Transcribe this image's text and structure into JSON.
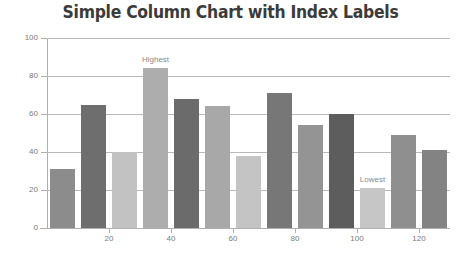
{
  "chart_data": {
    "type": "bar",
    "title": "Simple Column Chart with Index Labels",
    "xlabel": "",
    "ylabel": "",
    "ylim": [
      0,
      100
    ],
    "xlim": [
      0,
      140
    ],
    "grid": true,
    "legend": false,
    "y_ticks": [
      "0",
      "20",
      "40",
      "60",
      "80",
      "100"
    ],
    "y_tick_values": [
      0,
      20,
      40,
      60,
      80,
      100
    ],
    "x_ticks": [
      "20",
      "40",
      "60",
      "80",
      "100",
      "120"
    ],
    "x_tick_values": [
      20,
      40,
      60,
      80,
      100,
      120
    ],
    "categories": [
      10,
      20,
      30,
      40,
      50,
      60,
      70,
      80,
      90,
      100,
      110,
      120,
      130
    ],
    "values": [
      31,
      65,
      40,
      84,
      68,
      64,
      38,
      71,
      54,
      60,
      21,
      49,
      41
    ],
    "bar_colors": [
      "#8c8c8c",
      "#6e6e6e",
      "#c2c2c2",
      "#adadad",
      "#6b6b6b",
      "#a8a8a8",
      "#c4c4c4",
      "#777777",
      "#949494",
      "#5d5d5d",
      "#c6c6c6",
      "#8f8f8f",
      "#838383"
    ],
    "annotations": [
      {
        "label": "Highest",
        "index": 3,
        "value": 84
      },
      {
        "label": "Lowest",
        "index": 10,
        "value": 21
      }
    ],
    "colors": {
      "background": "#ffffff",
      "title": "#3b3b3b",
      "grid": "#b9b9b9",
      "axis": "#b0b0b0",
      "tick_text": "#7a7a7a",
      "annotation_text": "#8a8a8a"
    }
  }
}
